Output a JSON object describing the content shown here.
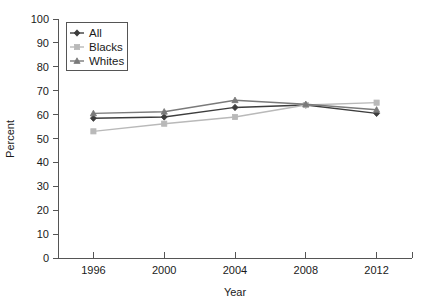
{
  "chart_data": {
    "type": "line",
    "title": "",
    "xlabel": "Year",
    "ylabel": "Percent",
    "categories": [
      "1996",
      "2000",
      "2004",
      "2008",
      "2012"
    ],
    "x": [
      1996,
      2000,
      2004,
      2008,
      2012
    ],
    "xlim": [
      1994,
      2014
    ],
    "ylim": [
      0,
      100
    ],
    "ytick_labels": [
      "0",
      "10",
      "20",
      "30",
      "40",
      "50",
      "60",
      "70",
      "80",
      "90",
      "100"
    ],
    "yticks": [
      0,
      10,
      20,
      30,
      40,
      50,
      60,
      70,
      80,
      90,
      100
    ],
    "grid": false,
    "legend_position": "upper-left",
    "series": [
      {
        "name": "All",
        "values": [
          58.5,
          59.0,
          63.0,
          64.0,
          60.5
        ],
        "color": "#3d3d3d",
        "marker": "diamond"
      },
      {
        "name": "Blacks",
        "values": [
          53.0,
          56.2,
          59.0,
          64.0,
          65.0
        ],
        "color": "#b9b9b9",
        "marker": "square"
      },
      {
        "name": "Whites",
        "values": [
          60.5,
          61.2,
          66.0,
          64.3,
          62.0
        ],
        "color": "#7a7a7a",
        "marker": "triangle"
      }
    ]
  },
  "legend": {
    "entries": [
      {
        "label": "All"
      },
      {
        "label": "Blacks"
      },
      {
        "label": "Whites"
      }
    ]
  },
  "axes": {
    "x_title": "Year",
    "y_title": "Percent"
  }
}
